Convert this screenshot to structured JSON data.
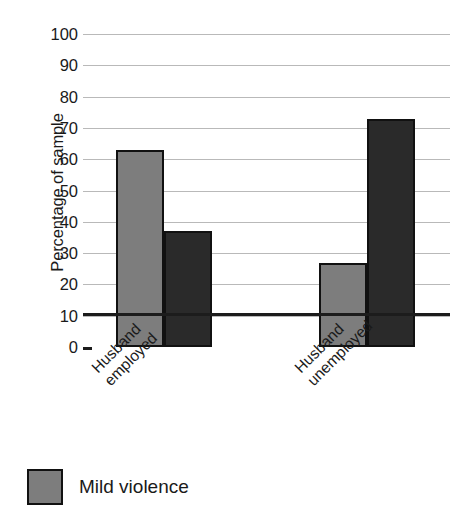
{
  "chart_data": {
    "type": "bar",
    "title": "",
    "xlabel": "",
    "ylabel": "Percentage of sample",
    "categories": [
      "Husband employed",
      "Husband unemployed"
    ],
    "category_lines": [
      [
        "Husband",
        "employed"
      ],
      [
        "Husband",
        "unemployed"
      ]
    ],
    "series": [
      {
        "name": "Mild violence",
        "color": "#7d7d7d",
        "values": [
          63,
          27
        ]
      },
      {
        "name": "Severe violence",
        "color": "#2a2a2a",
        "values": [
          37,
          73
        ]
      }
    ],
    "ylim": [
      0,
      100
    ],
    "ytick_labels": [
      "100",
      "90",
      "80",
      "70",
      "60",
      "50",
      "40",
      "30",
      "20",
      "10",
      "0"
    ],
    "ytick_values": [
      100,
      90,
      80,
      70,
      60,
      50,
      40,
      30,
      20,
      10,
      0
    ],
    "grid": true,
    "legend_position": "bottom-left",
    "legend": [
      {
        "label": "Mild violence",
        "color": "#7d7d7d"
      }
    ],
    "gridline_color": "#b9b9b9",
    "axis_color": "#1c1c1c",
    "bar_border_color": "#111111"
  }
}
